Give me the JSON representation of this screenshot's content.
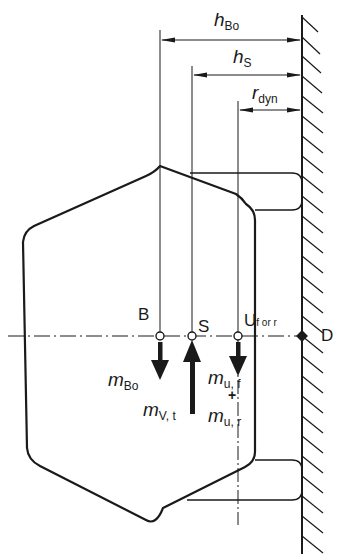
{
  "diagram": {
    "type": "tire cross-section with force/mass diagram",
    "colors": {
      "line": "#1a1a1a",
      "background": "#ffffff"
    },
    "dimensions": [
      {
        "id": "h_bo",
        "symbol": "h",
        "subscript": "Bo"
      },
      {
        "id": "h_s",
        "symbol": "h",
        "subscript": "S"
      },
      {
        "id": "r_dyn",
        "symbol": "r",
        "subscript": "dyn"
      }
    ],
    "points": [
      {
        "id": "B",
        "label": "B"
      },
      {
        "id": "S",
        "label": "S"
      },
      {
        "id": "U",
        "label": "U",
        "subscript": "f or r"
      },
      {
        "id": "D",
        "label": "D"
      }
    ],
    "masses": [
      {
        "id": "m_bo",
        "symbol": "m",
        "subscript": "Bo",
        "direction": "down"
      },
      {
        "id": "m_vt",
        "symbol": "m",
        "subscript": "V, t",
        "direction": "up"
      },
      {
        "id": "m_uf",
        "symbol": "m",
        "subscript": "u, f",
        "direction": "down"
      },
      {
        "id": "plus",
        "symbol": "+"
      },
      {
        "id": "m_ur",
        "symbol": "m",
        "subscript": "u, r"
      }
    ],
    "ground": {
      "label": "road surface (hatched wall)"
    }
  }
}
